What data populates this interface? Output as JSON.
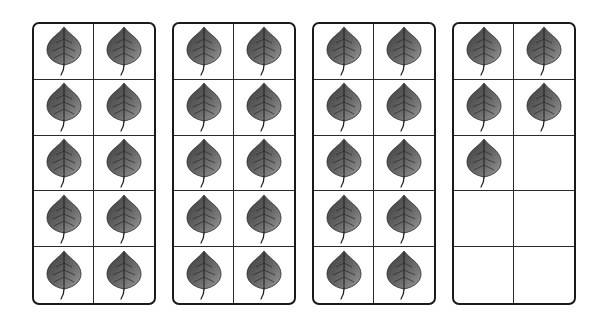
{
  "worksheet": {
    "type": "ten-frame counting",
    "object": "leaf",
    "total_count": 35,
    "frames": [
      {
        "id": 1,
        "rows": 5,
        "cols": 2,
        "filled": 10,
        "left": 32
      },
      {
        "id": 2,
        "rows": 5,
        "cols": 2,
        "filled": 10,
        "left": 172
      },
      {
        "id": 3,
        "rows": 5,
        "cols": 2,
        "filled": 10,
        "left": 312
      },
      {
        "id": 4,
        "rows": 5,
        "cols": 2,
        "filled": 5,
        "left": 452
      }
    ]
  },
  "colors": {
    "frame_border": "#1a1a1a",
    "grid_line": "#2a2a2a",
    "leaf_dark": "#3a3a3a",
    "leaf_mid": "#6b6b6b",
    "leaf_light": "#9a9a9a",
    "background": "#ffffff"
  },
  "icons": {
    "filled_cell": "leaf-icon",
    "empty_cell": "none"
  }
}
